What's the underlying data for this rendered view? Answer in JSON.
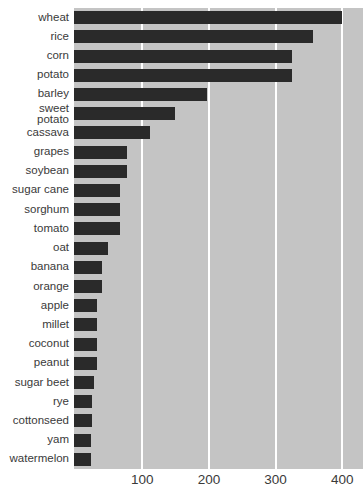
{
  "chart_data": {
    "type": "bar",
    "orientation": "horizontal",
    "title": "",
    "xlabel": "",
    "ylabel": "",
    "categories": [
      "wheat",
      "rice",
      "corn",
      "potato",
      "sweet\npotato_placeholder_fixed_below",
      "cassava"
    ],
    "note": "categories listed fully in rows below",
    "rows": [
      {
        "label": "wheat",
        "value": 400
      },
      {
        "label": "rice",
        "value": 356
      },
      {
        "label": "corn",
        "value": 324
      },
      {
        "label": "potato",
        "value": 324
      },
      {
        "label": "barley",
        "value": 197
      },
      {
        "label": "sweet\npotato",
        "value": 149
      },
      {
        "label": "cassava",
        "value": 112
      },
      {
        "label": "grapes",
        "value": 77
      },
      {
        "label": "soybean",
        "value": 77
      },
      {
        "label": "sugar cane",
        "value": 66
      },
      {
        "label": "sorghum",
        "value": 66
      },
      {
        "label": "tomato",
        "value": 66
      },
      {
        "label": "oat",
        "value": 49
      },
      {
        "label": "banana",
        "value": 39
      },
      {
        "label": "orange",
        "value": 39
      },
      {
        "label": "apple",
        "value": 32
      },
      {
        "label": "millet",
        "value": 32
      },
      {
        "label": "coconut",
        "value": 32
      },
      {
        "label": "peanut",
        "value": 32
      },
      {
        "label": "sugar beet",
        "value": 28
      },
      {
        "label": "rye",
        "value": 24
      },
      {
        "label": "cottonseed",
        "value": 24
      },
      {
        "label": "yam",
        "value": 23
      },
      {
        "label": "watermelon",
        "value": 23
      }
    ],
    "x_ticks": [
      "100",
      "200",
      "300",
      "400"
    ],
    "x_tick_values": [
      100,
      200,
      300,
      400
    ],
    "xlim": [
      0,
      431
    ],
    "grid": true,
    "legend": false,
    "colors": {
      "bar": "#2a2a2a",
      "panel_bg": "#c4c4c4",
      "gridline": "#ffffff",
      "text": "#3a3a3a",
      "page_bg": "#ffffff"
    }
  }
}
